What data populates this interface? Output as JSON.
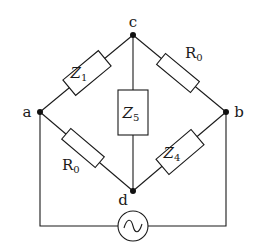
{
  "diagram": {
    "type": "bridge-circuit",
    "nodes": [
      {
        "id": "a",
        "label": "a"
      },
      {
        "id": "b",
        "label": "b"
      },
      {
        "id": "c",
        "label": "c"
      },
      {
        "id": "d",
        "label": "d"
      }
    ],
    "components": [
      {
        "id": "z1",
        "base": "Z",
        "sub": "1",
        "from": "a",
        "to": "c"
      },
      {
        "id": "r0-cb",
        "base": "R",
        "sub": "0",
        "from": "c",
        "to": "b"
      },
      {
        "id": "r0-ad",
        "base": "R",
        "sub": "0",
        "from": "a",
        "to": "d"
      },
      {
        "id": "z4",
        "base": "Z",
        "sub": "4",
        "from": "d",
        "to": "b"
      },
      {
        "id": "z5",
        "base": "Z",
        "sub": "5",
        "from": "c",
        "to": "d"
      },
      {
        "id": "source",
        "type": "ac-source",
        "symbol": "~",
        "from": "a",
        "to": "b"
      }
    ]
  }
}
